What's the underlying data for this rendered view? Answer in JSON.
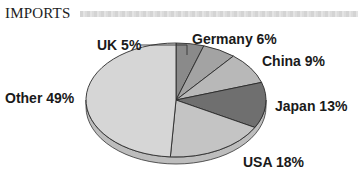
{
  "title": "IMPORTS",
  "chart_data": {
    "type": "pie",
    "title": "IMPORTS",
    "categories": [
      "UK",
      "Germany",
      "China",
      "Japan",
      "USA",
      "Other"
    ],
    "values": [
      5,
      6,
      9,
      13,
      18,
      49
    ],
    "unit": "%",
    "labels": [
      "UK 5%",
      "Germany 6%",
      "China 9%",
      "Japan 13%",
      "USA 18%",
      "Other 49%"
    ],
    "colors": [
      "#8a8a8a",
      "#a3a3a3",
      "#b8b8b8",
      "#6f6f6f",
      "#c4c4c4",
      "#d6d6d6"
    ],
    "start_angle": "12 o'clock",
    "direction": "clockwise",
    "style": "3D tilted pie"
  }
}
